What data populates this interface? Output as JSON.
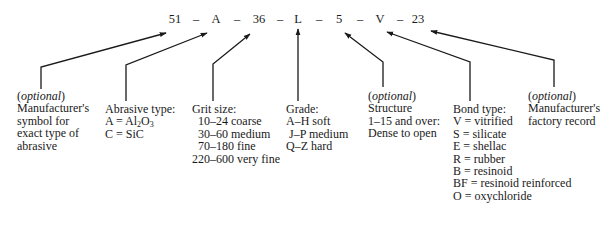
{
  "code": {
    "parts": [
      "51",
      "–",
      "A",
      "–",
      "36",
      "–",
      "L",
      "–",
      "5",
      "–",
      "V",
      "–",
      "23"
    ]
  },
  "optional_label": "optional",
  "blocks": {
    "manufacturer_symbol": {
      "optional": true,
      "lines": [
        "Manufacturer's",
        "symbol for",
        "exact type of",
        "abrasive"
      ]
    },
    "abrasive_type": {
      "title": "Abrasive type:",
      "items": [
        {
          "prefix": "A = Al",
          "sub1": "2",
          "mid": "O",
          "sub2": "3"
        },
        {
          "text": "C = SiC"
        }
      ]
    },
    "grit_size": {
      "title": "Grit size:",
      "lines": [
        "  10–24 coarse",
        "  30–60 medium",
        "  70–180 fine",
        "220–600 very fine"
      ]
    },
    "grade": {
      "title": "Grade:",
      "lines": [
        "A–H soft",
        " J–P medium",
        "Q–Z hard"
      ]
    },
    "structure": {
      "optional": true,
      "lines": [
        "Structure",
        "1–15 and over:",
        "Dense to open"
      ]
    },
    "bond_type": {
      "title": "Bond type:",
      "lines": [
        "V = vitrified",
        "S = silicate",
        "E = shellac",
        "R = rubber",
        "B = resinoid",
        "BF = resinoid reinforced",
        "O = oxychloride"
      ]
    },
    "factory_record": {
      "optional": true,
      "lines": [
        "Manufacturer's",
        "factory record"
      ]
    }
  },
  "colors": {
    "ink": "#1a1a1a",
    "background": "#ffffff"
  }
}
